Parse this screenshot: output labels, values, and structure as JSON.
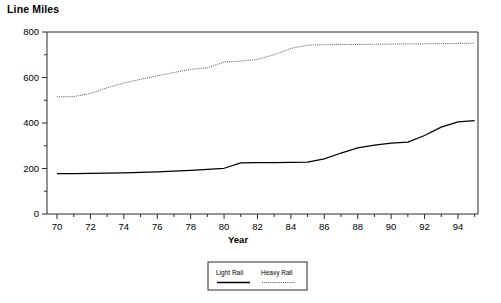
{
  "chart_data": {
    "type": "line",
    "title": "",
    "ylabel": "Line Miles",
    "xlabel": "Year",
    "xlim": [
      69.4,
      95.2
    ],
    "ylim": [
      0,
      800
    ],
    "grid": false,
    "legend_position": "bottom-center",
    "x_major_ticks": [
      70,
      72,
      74,
      76,
      78,
      80,
      82,
      84,
      86,
      88,
      90,
      92,
      94
    ],
    "x_minor_ticks": [
      71,
      73,
      75,
      77,
      79,
      81,
      83,
      85,
      87,
      89,
      91,
      93,
      95
    ],
    "y_major_ticks": [
      0,
      200,
      400,
      600,
      800
    ],
    "y_minor_ticks": [
      100,
      300,
      500,
      700
    ],
    "x": [
      70,
      71,
      72,
      73,
      74,
      75,
      76,
      77,
      78,
      79,
      80,
      81,
      82,
      83,
      84,
      85,
      86,
      87,
      88,
      89,
      90,
      91,
      92,
      93,
      94,
      95
    ],
    "series": [
      {
        "name": "Light Rail",
        "style": "solid",
        "color": "#000000",
        "values": [
          178,
          178,
          179,
          180,
          181,
          183,
          185,
          188,
          192,
          196,
          201,
          225,
          226,
          226,
          227,
          228,
          242,
          268,
          291,
          303,
          312,
          316,
          345,
          382,
          405,
          410
        ]
      },
      {
        "name": "Heavy Rail",
        "style": "dotted",
        "color": "#555555",
        "values": [
          515,
          516,
          530,
          555,
          576,
          592,
          607,
          622,
          636,
          642,
          668,
          672,
          680,
          700,
          728,
          742,
          744,
          745,
          745,
          746,
          747,
          748,
          748,
          749,
          750,
          751
        ]
      }
    ]
  },
  "legend": {
    "items": [
      {
        "label": "Light Rail",
        "style": "solid"
      },
      {
        "label": "Heavy Rail",
        "style": "dotted"
      }
    ]
  },
  "axis_titles": {
    "y": "Line Miles",
    "x": "Year"
  }
}
